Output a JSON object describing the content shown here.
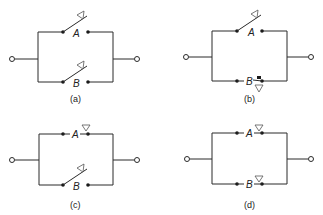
{
  "panels": [
    {
      "id": "a",
      "caption": "(a)",
      "switch_a": {
        "label": "A",
        "state": "open"
      },
      "switch_b": {
        "label": "B",
        "state": "open"
      }
    },
    {
      "id": "b",
      "caption": "(b)",
      "switch_a": {
        "label": "A",
        "state": "open"
      },
      "switch_b": {
        "label": "B",
        "state": "closed"
      }
    },
    {
      "id": "c",
      "caption": "(c)",
      "switch_a": {
        "label": "A",
        "state": "closed"
      },
      "switch_b": {
        "label": "B",
        "state": "open"
      }
    },
    {
      "id": "d",
      "caption": "(d)",
      "switch_a": {
        "label": "A",
        "state": "closed"
      },
      "switch_b": {
        "label": "B",
        "state": "closed"
      }
    }
  ],
  "colors": {
    "line": "#2a2a2a",
    "background": "#ffffff"
  }
}
